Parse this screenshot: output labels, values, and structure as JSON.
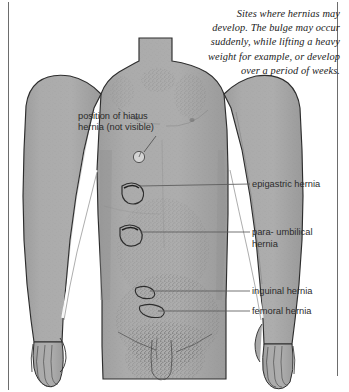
{
  "figure": {
    "title": "Sites where hernias may develop",
    "background_color": "#ffffff",
    "body_fill_color": "#a9a9a9",
    "outline_color": "#2b2b2b",
    "leader_line_color": "#555555"
  },
  "caption": {
    "lines": [
      "Sites where hernias may",
      "develop. The bulge may occur",
      "suddenly, while lifting a heavy",
      "weight for example, or develop",
      "over a period of weeks."
    ]
  },
  "labels": {
    "hiatus_line1": "position of hiatus",
    "hiatus_line2": "hernia (not visible)",
    "epigastric": "epigastric hernia",
    "paraumbilical": "para- umbilical hernia",
    "inguinal": "inguinal hernia",
    "femoral": "femoral hernia"
  }
}
